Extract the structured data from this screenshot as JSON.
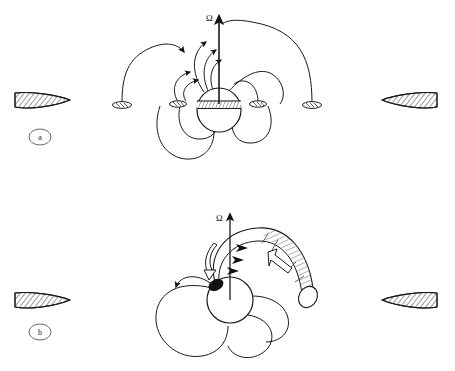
{
  "figure": {
    "width": 455,
    "height": 371,
    "background_color": "#ffffff",
    "line_color": "#1a1a1a"
  },
  "panels": [
    {
      "id": "a",
      "label": "a",
      "label_shape": "ellipse",
      "label_position": {
        "x": 40,
        "y": 137
      },
      "description": "Closed dipolar magnetic field lines linking the star to the accretion disk",
      "rotation_axis": {
        "symbol": "Ω",
        "symbol_position": {
          "x": 206,
          "y": 17
        },
        "arrow_from": {
          "x": 219,
          "y": 104
        },
        "arrow_to": {
          "x": 219,
          "y": 13
        }
      },
      "star": {
        "center": {
          "x": 219,
          "y": 110
        },
        "radius": 22,
        "equatorial_band": {
          "label": "hatched-equatorial-band",
          "y": 104,
          "height": 7,
          "hatch_count": 14
        }
      },
      "disk_wedges": [
        {
          "name": "left-disk-wedge",
          "cx": 42,
          "cy": 100,
          "rx": 27,
          "ry": 8,
          "tip": "right",
          "hatched": true
        },
        {
          "name": "right-disk-wedge",
          "cx": 410,
          "cy": 100,
          "rx": 27,
          "ry": 8,
          "tip": "left",
          "hatched": true
        }
      ],
      "footpoints": [
        {
          "name": "footpoint-far-left",
          "cx": 122,
          "cy": 105,
          "rx": 9,
          "ry": 3
        },
        {
          "name": "footpoint-left",
          "cx": 178,
          "cy": 104,
          "rx": 8,
          "ry": 3
        },
        {
          "name": "footpoint-right",
          "cx": 258,
          "cy": 104,
          "rx": 8,
          "ry": 3
        },
        {
          "name": "footpoint-far-right",
          "cx": 312,
          "cy": 105,
          "rx": 9,
          "ry": 3
        }
      ],
      "field_line_count": 8,
      "arrow_count": 5
    },
    {
      "id": "b",
      "label": "b",
      "label_shape": "ellipse",
      "label_position": {
        "x": 40,
        "y": 332
      },
      "description": "Inflated and twisted magnetic flux tube expanding away from the star",
      "rotation_axis": {
        "symbol": "Ω",
        "symbol_position": {
          "x": 218,
          "y": 217
        },
        "arrow_from": {
          "x": 230,
          "y": 292
        },
        "arrow_to": {
          "x": 230,
          "y": 211
        }
      },
      "star": {
        "center": {
          "x": 230,
          "y": 300
        },
        "radius": 23,
        "spot": {
          "label": "dark-polar-spot",
          "cx": 215,
          "cy": 284,
          "rx": 7,
          "ry": 5,
          "fill": "#111111"
        }
      },
      "disk_wedges": [
        {
          "name": "left-disk-wedge",
          "cx": 42,
          "cy": 300,
          "rx": 27,
          "ry": 8,
          "tip": "right",
          "hatched": true
        },
        {
          "name": "right-disk-wedge",
          "cx": 410,
          "cy": 300,
          "rx": 27,
          "ry": 8,
          "tip": "left",
          "hatched": true
        }
      ],
      "flux_tube": {
        "name": "twisted-flux-tube",
        "hatched": true,
        "end_cap": {
          "cx": 308,
          "cy": 297,
          "rx": 9,
          "ry": 12
        },
        "interior_arrow": {
          "label": "hollow-arrow-outward",
          "direction": "up-left"
        },
        "twist_arrow": {
          "label": "hollow-curved-twist-arrow",
          "direction": "counterclockwise"
        }
      },
      "field_line_count": 6,
      "arrow_count": 4
    }
  ]
}
